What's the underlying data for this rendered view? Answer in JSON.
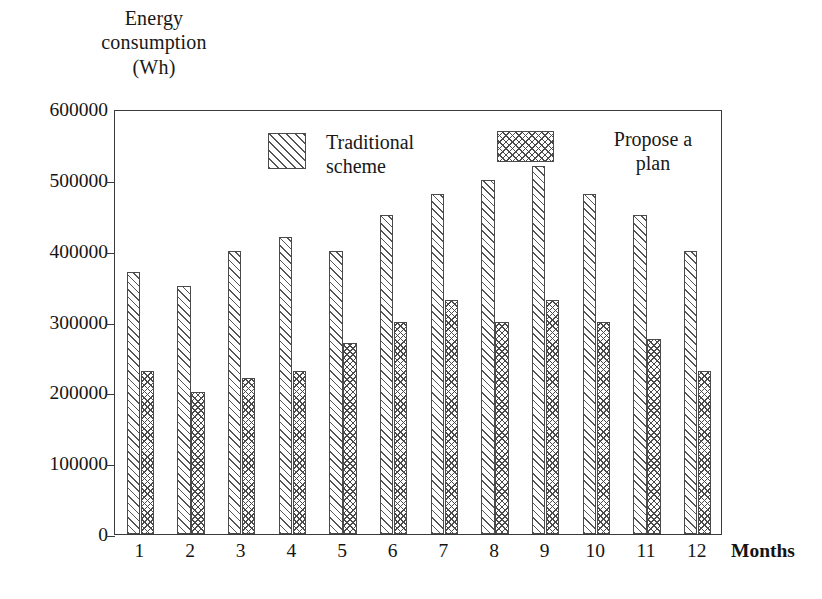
{
  "chart_data": {
    "type": "bar",
    "title": "",
    "ylabel_lines": [
      "Energy",
      "consumption",
      "(Wh)"
    ],
    "ylabel": "Energy consumption (Wh)",
    "xlabel": "Months",
    "categories": [
      "1",
      "2",
      "3",
      "4",
      "5",
      "6",
      "7",
      "8",
      "9",
      "10",
      "11",
      "12"
    ],
    "series": [
      {
        "name": "Traditional scheme",
        "values": [
          370000,
          350000,
          400000,
          420000,
          400000,
          450000,
          480000,
          500000,
          520000,
          480000,
          450000,
          400000
        ]
      },
      {
        "name": "Propose a plan",
        "values": [
          230000,
          200000,
          220000,
          230000,
          270000,
          300000,
          330000,
          300000,
          330000,
          300000,
          275000,
          230000
        ]
      }
    ],
    "ylim": [
      0,
      600000
    ],
    "ytick_values": [
      0,
      100000,
      200000,
      300000,
      400000,
      500000,
      600000
    ],
    "ytick_labels": [
      "0",
      "100000",
      "200000",
      "300000",
      "400000",
      "500000",
      "600000"
    ],
    "grid": false,
    "legend_position": "inside-top",
    "frame": "box"
  },
  "legend": {
    "entries": [
      {
        "label": "Traditional\nscheme",
        "pattern": "diagonal-hatch"
      },
      {
        "label": "Propose a\nplan",
        "pattern": "cross-hatch"
      }
    ]
  },
  "colors": {
    "axis": "#3a3a3a",
    "bar_outline": "#4a4a4a",
    "hatch": "#555555",
    "text": "#141414",
    "background": "#ffffff"
  }
}
